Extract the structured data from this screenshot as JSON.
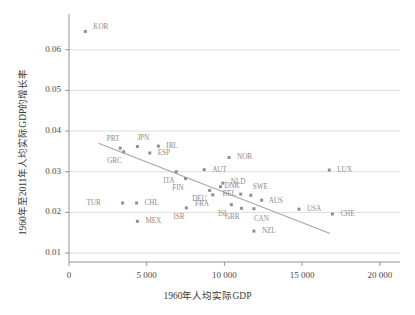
{
  "chart_data": {
    "type": "scatter",
    "title": "",
    "xlabel": "1960年人均实际GDP",
    "ylabel": "1960年至2011年人均实际GDP的增长率",
    "xlim": [
      0,
      21300
    ],
    "ylim": [
      0.0078,
      0.0678
    ],
    "grid": "horizontal",
    "legend": "none",
    "xticks": [
      {
        "value": 0,
        "label": "0"
      },
      {
        "value": 5000,
        "label": "5 000"
      },
      {
        "value": 10000,
        "label": "10 000"
      },
      {
        "value": 15000,
        "label": "15 000"
      },
      {
        "value": 20000,
        "label": "20 000"
      }
    ],
    "yticks": [
      {
        "value": 0.01,
        "label": "0.01"
      },
      {
        "value": 0.02,
        "label": "0.02"
      },
      {
        "value": 0.03,
        "label": "0.03"
      },
      {
        "value": 0.04,
        "label": "0.04"
      },
      {
        "value": 0.05,
        "label": "0.05"
      },
      {
        "value": 0.06,
        "label": "0.06"
      }
    ],
    "marker_color": "#8f8f8f",
    "line_color": "#a6a6a6",
    "grid_color": "#d4d4d4",
    "axis_color": "#8a8a8a",
    "points": [
      {
        "label": "KOR",
        "x": 1050,
        "y": 0.0645,
        "lx": 8,
        "ly": -4
      },
      {
        "label": "PRT",
        "x": 3300,
        "y": 0.0358,
        "lx": -1,
        "ly": -9
      },
      {
        "label": "GRC",
        "x": 3520,
        "y": 0.0349,
        "lx": -2,
        "ly": 9
      },
      {
        "label": "JPN",
        "x": 4400,
        "y": 0.0362,
        "lx": 0,
        "ly": -9
      },
      {
        "label": "ESP",
        "x": 5200,
        "y": 0.0346,
        "lx": 8,
        "ly": 0
      },
      {
        "label": "IRL",
        "x": 5750,
        "y": 0.0363,
        "lx": 8,
        "ly": 0
      },
      {
        "label": "TUR",
        "x": 3450,
        "y": 0.0223,
        "lx": -22,
        "ly": 0
      },
      {
        "label": "CHL",
        "x": 4350,
        "y": 0.0223,
        "lx": 8,
        "ly": 0
      },
      {
        "label": "MEX",
        "x": 4400,
        "y": 0.0178,
        "lx": 8,
        "ly": 0
      },
      {
        "label": "ITA",
        "x": 6900,
        "y": 0.03,
        "lx": -2,
        "ly": 9
      },
      {
        "label": "FIN",
        "x": 7500,
        "y": 0.0283,
        "lx": -2,
        "ly": 9
      },
      {
        "label": "ISR",
        "x": 7550,
        "y": 0.0211,
        "lx": -2,
        "ly": 9
      },
      {
        "label": "AUT",
        "x": 8700,
        "y": 0.0305,
        "lx": 8,
        "ly": 0
      },
      {
        "label": "DEU",
        "x": 9050,
        "y": 0.0254,
        "lx": -3,
        "ly": 9
      },
      {
        "label": "FRA",
        "x": 9250,
        "y": 0.0243,
        "lx": -4,
        "ly": 9
      },
      {
        "label": "NLD",
        "x": 9900,
        "y": 0.0272,
        "lx": 8,
        "ly": -1
      },
      {
        "label": "BEL",
        "x": 9750,
        "y": 0.0263,
        "lx": 2,
        "ly": 7
      },
      {
        "label": "NOR",
        "x": 10300,
        "y": 0.0335,
        "lx": 8,
        "ly": 0
      },
      {
        "label": "ISL",
        "x": 10450,
        "y": 0.0219,
        "lx": -3,
        "ly": 9
      },
      {
        "label": "GBR",
        "x": 11100,
        "y": 0.021,
        "lx": -2,
        "ly": 9
      },
      {
        "label": "DNK",
        "x": 11050,
        "y": 0.0245,
        "lx": -1,
        "ly": -8
      },
      {
        "label": "SWE",
        "x": 11700,
        "y": 0.0242,
        "lx": 2,
        "ly": -8
      },
      {
        "label": "CAN",
        "x": 11900,
        "y": 0.0209,
        "lx": 0,
        "ly": 10
      },
      {
        "label": "AUS",
        "x": 12400,
        "y": 0.023,
        "lx": 7,
        "ly": 1
      },
      {
        "label": "NZL",
        "x": 11900,
        "y": 0.0154,
        "lx": 8,
        "ly": 0
      },
      {
        "label": "USA",
        "x": 14800,
        "y": 0.0208,
        "lx": 8,
        "ly": 0
      },
      {
        "label": "CHE",
        "x": 16950,
        "y": 0.0196,
        "lx": 8,
        "ly": 0
      },
      {
        "label": "LUX",
        "x": 16750,
        "y": 0.0304,
        "lx": 8,
        "ly": 0
      }
    ],
    "trend_line": {
      "x_start": 1900,
      "y_start": 0.037,
      "x_end": 16800,
      "y_end": 0.0148
    }
  }
}
